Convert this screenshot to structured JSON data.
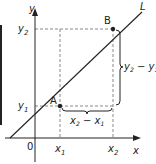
{
  "diagram": {
    "line_label": "L",
    "axes": {
      "x_label": "x",
      "y_label": "y",
      "origin_label": "0"
    },
    "points": [
      {
        "name": "A",
        "x_label": "x1",
        "y_label": "y1"
      },
      {
        "name": "B",
        "x_label": "x2",
        "y_label": "y2"
      }
    ],
    "ticks": {
      "x1": "x",
      "x1_sub": "1",
      "x2": "x",
      "x2_sub": "2",
      "y1": "y",
      "y1_sub": "1",
      "y2": "y",
      "y2_sub": "2"
    },
    "brackets": {
      "rise": {
        "a": "y",
        "a_sub": "2",
        "op": " − ",
        "b": "y",
        "b_sub": "1"
      },
      "run": {
        "a": "x",
        "a_sub": "2",
        "op": " − ",
        "b": "x",
        "b_sub": "1"
      }
    },
    "colors": {
      "ink": "#222222",
      "dashed": "#888888",
      "background": "#ffffff"
    }
  }
}
